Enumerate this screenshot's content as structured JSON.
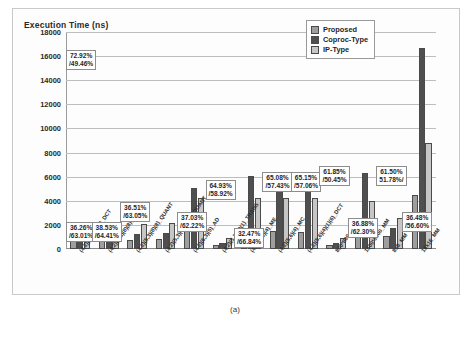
{
  "caption": "(a)",
  "legend": {
    "position": "top-right",
    "entries": [
      {
        "label": "Proposed",
        "color": "#9e9e9e"
      },
      {
        "label": "Coproc-Type",
        "color": "#4f4f4f"
      },
      {
        "label": "IP-Type",
        "color": "#c6c6c6"
      }
    ]
  },
  "chart_data": {
    "type": "bar",
    "title": "Execution Time (ns)",
    "xlabel": "",
    "ylabel": "Execution Time (ns)",
    "ylim": [
      0,
      18000
    ],
    "yticks": [
      0,
      2000,
      4000,
      6000,
      8000,
      10000,
      12000,
      14000,
      16000,
      18000
    ],
    "grid": true,
    "categories": [
      "(4,2)(5,3)(8)(8)_DCT",
      "(4,2)(5,3)(8)(8)_IDCT",
      "(4,2)(5,3)(8)(8)_QUANT",
      "(4,2)(5,3)(8)(8)_DEQUANT",
      "(4,2)(6,3)(5)_AD",
      "(4,2)(5,3)(4)(1)_TRANS",
      "(4,2)(5,6)(4)_ME",
      "(4,2)(5,6)(4)_MC",
      "(4,2)(5,6)(4)(1)(6)_DCT",
      "800*800_MM",
      "1600*1600_MM",
      "8x8_MM",
      "16x16_MM"
    ],
    "series": [
      {
        "name": "Proposed",
        "color": "#9e9e9e",
        "values": [
          700,
          720,
          780,
          850,
          1750,
          300,
          1500,
          1500,
          1450,
          330,
          1500,
          1100,
          4500
        ]
      },
      {
        "name": "Coproc-Type",
        "color": "#4f4f4f",
        "values": [
          1100,
          1150,
          1250,
          1350,
          5050,
          470,
          6050,
          6050,
          6100,
          520,
          6300,
          1750,
          16700
        ]
      },
      {
        "name": "IP-Type",
        "color": "#c6c6c6",
        "values": [
          1900,
          1950,
          2050,
          2150,
          4200,
          910,
          4200,
          4200,
          4250,
          900,
          4000,
          2550,
          8800
        ]
      }
    ],
    "annotations": [
      {
        "group_index": 0,
        "line1": "36.26%",
        "line2": "/63.01%"
      },
      {
        "group_index": 1,
        "line1": "38.53%",
        "line2": "/64.41%"
      },
      {
        "group_index": 2,
        "line1": "36.51%",
        "line2": "/63.05%"
      },
      {
        "group_index": 4,
        "line1": "37.03%",
        "line2": "/62.22%"
      },
      {
        "group_index": 5,
        "line1": "64.93%",
        "line2": "/58.92%"
      },
      {
        "group_index": 6,
        "line1": "32.47%",
        "line2": "/66.84%"
      },
      {
        "group_index": 7,
        "line1": "65.08%",
        "line2": "/57.43%"
      },
      {
        "group_index": 8,
        "line1": "65.15%",
        "line2": "/57.06%"
      },
      {
        "group_index": 9,
        "line1": "61.85%",
        "line2": "/50.45%"
      },
      {
        "group_index": 10,
        "line1": "36.88%",
        "line2": "/62.30%"
      },
      {
        "group_index": 11,
        "line1": "61.50%",
        "line2": "51.78%/"
      },
      {
        "group_index": 12,
        "line1": "36.48%",
        "line2": "/56.60%"
      },
      {
        "group_index": 13,
        "line1": "72.92%",
        "line2": "/49.46%"
      }
    ]
  }
}
